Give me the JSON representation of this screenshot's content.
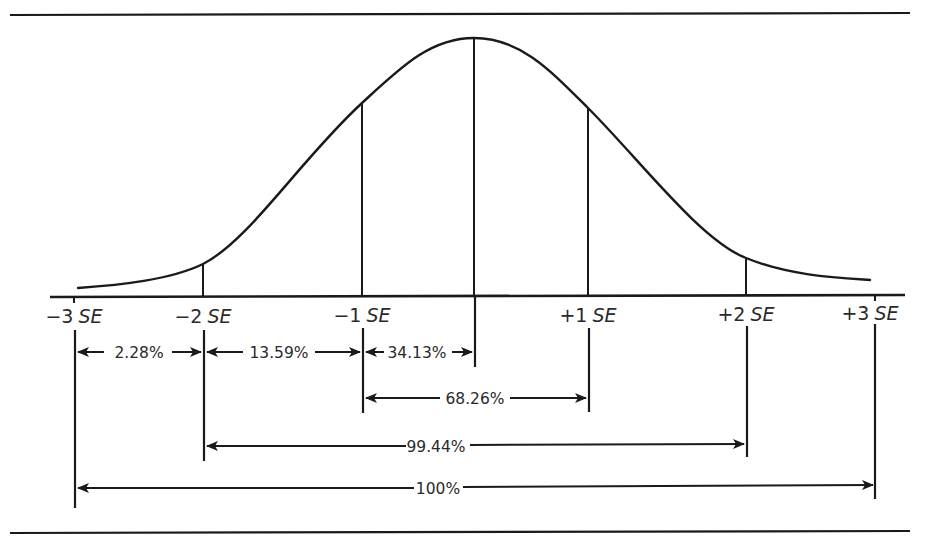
{
  "diagram": {
    "type": "normal-distribution-curve",
    "colors": {
      "ink": "#1a1a1a",
      "label": "#2a2a2a",
      "background": "#ffffff"
    },
    "axis": {
      "ticks": [
        {
          "id": "m3",
          "sign": "−3",
          "unit": "SE",
          "x": 74
        },
        {
          "id": "m2",
          "sign": "−2",
          "unit": "SE",
          "x": 203
        },
        {
          "id": "m1",
          "sign": "−1",
          "unit": "SE",
          "x": 362
        },
        {
          "id": "p1",
          "sign": "+1",
          "unit": "SE",
          "x": 588
        },
        {
          "id": "p2",
          "sign": "+2",
          "unit": "SE",
          "x": 746
        },
        {
          "id": "p3",
          "sign": "+3",
          "unit": "SE",
          "x": 875
        }
      ],
      "mean_x": 474
    },
    "intervals": [
      {
        "label": "2.28%",
        "from": "−3 SE",
        "to": "−2 SE"
      },
      {
        "label": "13.59%",
        "from": "−2 SE",
        "to": "−1 SE"
      },
      {
        "label": "34.13%",
        "from": "−1 SE",
        "to": "mean"
      },
      {
        "label": "68.26%",
        "from": "−1 SE",
        "to": "+1 SE"
      },
      {
        "label": "99.44%",
        "from": "−2 SE",
        "to": "+2 SE"
      },
      {
        "label": "100%",
        "from": "−3 SE",
        "to": "+3 SE"
      }
    ]
  }
}
